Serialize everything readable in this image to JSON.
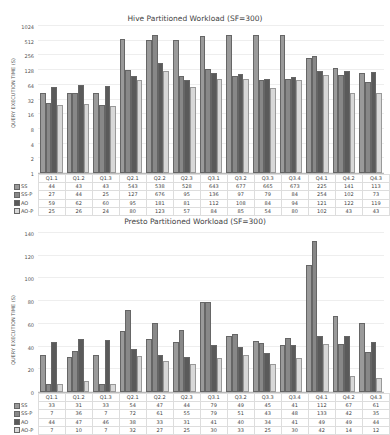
{
  "chart_data": [
    {
      "type": "bar",
      "title": "Hive Partitioned Workload (SF=300)",
      "xlabel": "",
      "ylabel": "QUERY EXECUTION TIME (S)",
      "yscale": "log2",
      "ylim": [
        1,
        1024
      ],
      "yticks": [
        "1",
        "2",
        "4",
        "8",
        "16",
        "32",
        "64",
        "128",
        "256",
        "512",
        "1024"
      ],
      "grid": true,
      "legend_position": "table-below",
      "categories": [
        "Q1.1",
        "Q1.2",
        "Q1.3",
        "Q2.1",
        "Q2.2",
        "Q2.3",
        "Q3.1",
        "Q3.2",
        "Q3.3",
        "Q3.4",
        "Q4.1",
        "Q4.2",
        "Q4.3"
      ],
      "series": [
        {
          "name": "SS",
          "color": "#9a9a9a",
          "values": [
            44,
            43,
            43,
            543,
            538,
            528,
            643,
            677,
            665,
            673,
            225,
            141,
            113
          ]
        },
        {
          "name": "SS-P",
          "color": "#888888",
          "values": [
            27,
            44,
            25,
            127,
            676,
            95,
            136,
            97,
            79,
            84,
            254,
            102,
            73
          ]
        },
        {
          "name": "AO",
          "color": "#5a5a5a",
          "values": [
            59,
            62,
            60,
            95,
            181,
            81,
            112,
            108,
            84,
            94,
            121,
            122,
            119
          ]
        },
        {
          "name": "AO-P",
          "color": "#d8d8d8",
          "values": [
            25,
            26,
            24,
            80,
            123,
            57,
            84,
            85,
            54,
            80,
            102,
            43,
            43
          ]
        }
      ]
    },
    {
      "type": "bar",
      "title": "Presto Partitioned Workload (SF=300)",
      "xlabel": "",
      "ylabel": "QUERY EXECUTION TIME (S)",
      "yscale": "linear",
      "ylim": [
        0,
        140
      ],
      "yticks": [
        "0",
        "20",
        "40",
        "60",
        "80",
        "100",
        "120",
        "140"
      ],
      "grid": true,
      "legend_position": "table-below",
      "categories": [
        "Q1.1",
        "Q1.2",
        "Q1.3",
        "Q2.1",
        "Q2.2",
        "Q2.3",
        "Q3.1",
        "Q3.2",
        "Q3.3",
        "Q3.4",
        "Q4.1",
        "Q4.2",
        "Q4.3"
      ],
      "series": [
        {
          "name": "SS",
          "color": "#9a9a9a",
          "values": [
            33,
            31,
            33,
            54,
            47,
            44,
            79,
            49,
            45,
            41,
            112,
            67,
            61
          ]
        },
        {
          "name": "SS-P",
          "color": "#888888",
          "values": [
            7,
            36,
            7,
            72,
            61,
            55,
            79,
            51,
            43,
            48,
            133,
            42,
            35
          ]
        },
        {
          "name": "AO",
          "color": "#5a5a5a",
          "values": [
            44,
            47,
            46,
            38,
            33,
            31,
            41,
            40,
            34,
            41,
            49,
            49,
            44
          ]
        },
        {
          "name": "AO-P",
          "color": "#d8d8d8",
          "values": [
            7,
            10,
            7,
            32,
            27,
            25,
            30,
            33,
            25,
            30,
            42,
            14,
            12
          ]
        }
      ]
    }
  ]
}
